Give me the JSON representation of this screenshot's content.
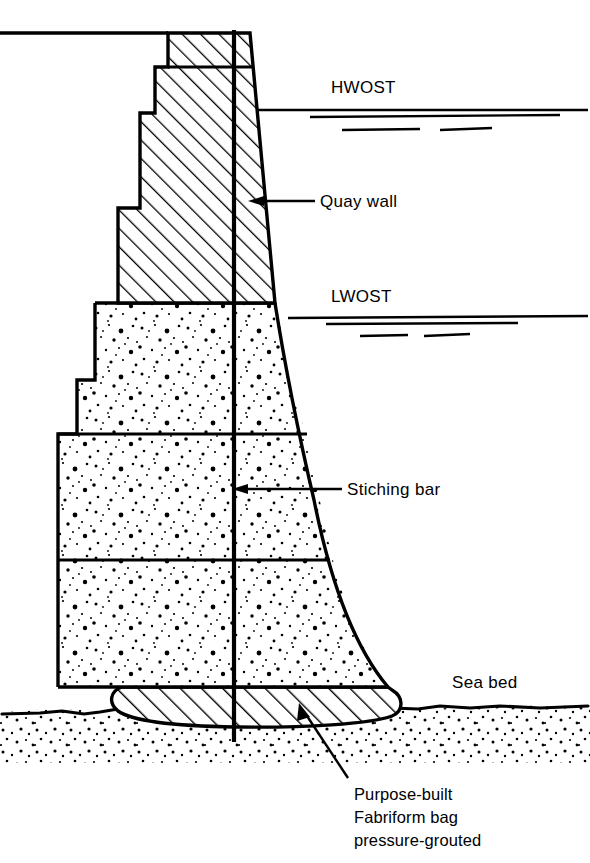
{
  "figure": {
    "background_color": "#ffffff",
    "ink_color": "#000000"
  },
  "labels": {
    "hwost": "HWOST",
    "lwost": "LWOST",
    "quay_wall": "Quay wall",
    "stiching_bar": "Stiching bar",
    "sea_bed": "Sea bed",
    "fabriform_line1": "Purpose-built",
    "fabriform_line2": "Fabriform bag",
    "fabriform_line3": "pressure-grouted"
  },
  "annotations": [
    {
      "name": "hwost",
      "text": "HWOST",
      "x": 331,
      "y": 93,
      "kind": "water-level"
    },
    {
      "name": "lwost",
      "text": "LWOST",
      "x": 331,
      "y": 302,
      "kind": "water-level"
    },
    {
      "name": "quay-wall",
      "text": "Quay wall",
      "x": 320,
      "y": 206,
      "kind": "leader-arrow"
    },
    {
      "name": "stiching-bar",
      "text": "Stiching bar",
      "x": 347,
      "y": 494,
      "kind": "leader-arrow"
    },
    {
      "name": "sea-bed",
      "text": "Sea bed",
      "x": 452,
      "y": 682,
      "kind": "plain"
    },
    {
      "name": "fabriform-bag",
      "text": "Purpose-built Fabriform bag pressure-grouted",
      "x": 358,
      "y": 795,
      "kind": "leader-arrow"
    }
  ],
  "components": {
    "quay_wall": {
      "name": "Quay wall",
      "hatch": "diagonal-45",
      "description": "Stepped mass-concrete wall above low water, hatched"
    },
    "concrete_blocks": {
      "name": "Concrete block courses",
      "hatch": "stipple-dots",
      "courses": 3,
      "description": "Stippled precast concrete blocks between LWOST and sea bed"
    },
    "fabriform_bag": {
      "name": "Purpose-built Fabriform bag pressure-grouted",
      "hatch": "diagonal-45",
      "description": "Grout-filled fabric bag forming the levelling bed on the sea bed"
    },
    "stiching_bar": {
      "name": "Stiching bar",
      "description": "Continuous vertical tie bar through wall, blocks and bag"
    },
    "sea_bed": {
      "name": "Sea bed",
      "hatch": "stipple-dots",
      "description": "Stippled seabed soil line"
    }
  },
  "water_levels": [
    {
      "name": "HWOST",
      "label": "HWOST",
      "y": 110,
      "description": "High Water Ordinary Spring Tide"
    },
    {
      "name": "LWOST",
      "label": "LWOST",
      "y": 318,
      "description": "Low Water Ordinary Spring Tide"
    }
  ]
}
